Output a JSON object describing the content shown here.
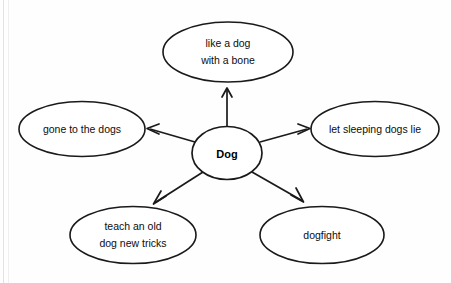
{
  "diagram": {
    "type": "word-web",
    "center": {
      "label": "Dog",
      "shape": "circle",
      "bold": true
    },
    "nodes": [
      {
        "id": "like-a-dog-with-a-bone",
        "line1": "like a dog",
        "line2": "with a bone",
        "position": "top"
      },
      {
        "id": "gone-to-the-dogs",
        "line1": "gone to the dogs",
        "line2": "",
        "position": "left"
      },
      {
        "id": "let-sleeping-dogs-lie",
        "line1": "let sleeping dogs lie",
        "line2": "",
        "position": "right"
      },
      {
        "id": "teach-an-old-dog-new-tricks",
        "line1": "teach an old",
        "line2": "dog new tricks",
        "position": "bottom-left"
      },
      {
        "id": "dogfight",
        "line1": "dogfight",
        "line2": "",
        "position": "bottom-right"
      }
    ],
    "connectors": [
      {
        "from": "Dog",
        "to": "like a dog with a bone",
        "arrow": "outward"
      },
      {
        "from": "Dog",
        "to": "gone to the dogs",
        "arrow": "outward"
      },
      {
        "from": "Dog",
        "to": "let sleeping dogs lie",
        "arrow": "outward"
      },
      {
        "from": "Dog",
        "to": "teach an old dog new tricks",
        "arrow": "outward"
      },
      {
        "from": "Dog",
        "to": "dogfight",
        "arrow": "outward"
      }
    ],
    "colors": {
      "stroke": "#1a1a1a",
      "fill": "#ffffff",
      "text": "#0d0d0d",
      "background": "#fefefe"
    }
  }
}
